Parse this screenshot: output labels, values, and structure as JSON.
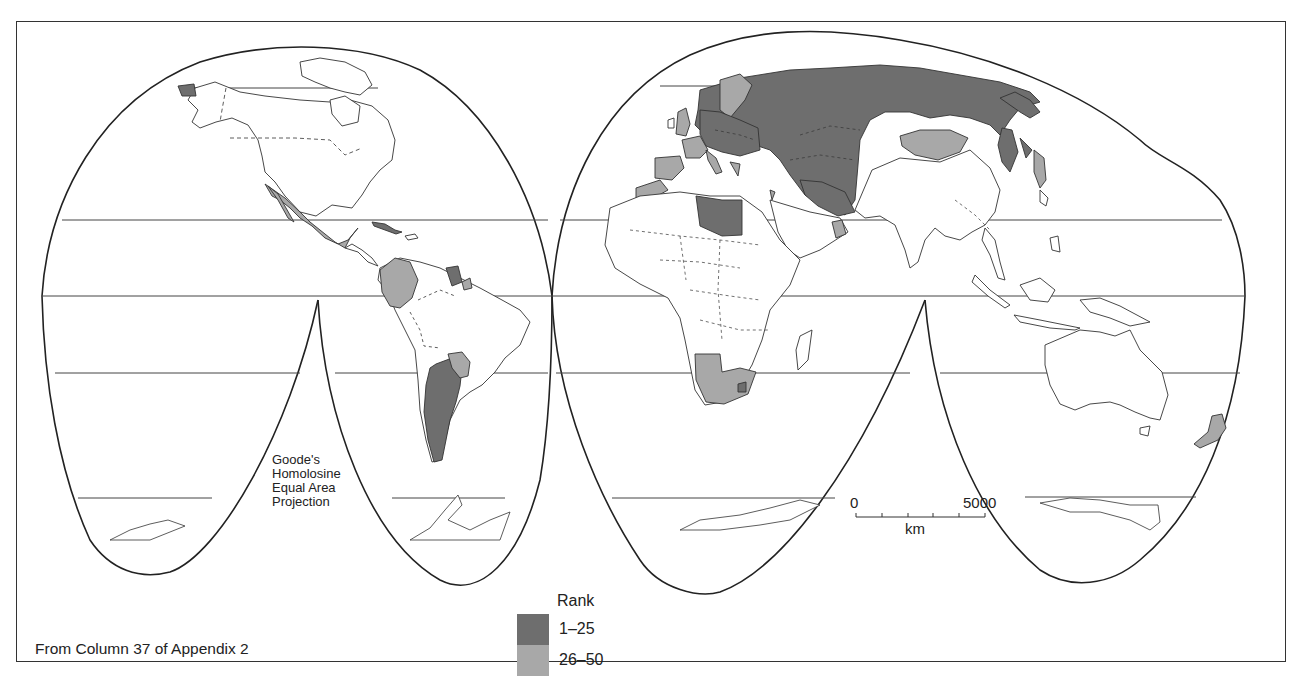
{
  "map": {
    "projection_label": [
      "Goode's",
      "Homolosine",
      "Equal Area",
      "Projection"
    ],
    "source_note": "From Column 37 of Appendix 2",
    "legend": {
      "title": "Rank",
      "items": [
        {
          "label": "1–25",
          "color": "#6e6e6e"
        },
        {
          "label": "26–50",
          "color": "#a8a8a8"
        }
      ]
    },
    "scale_bar": {
      "start_label": "0",
      "end_label": "5000",
      "unit": "km",
      "ticks": 5
    },
    "colors": {
      "rank_1_25": "#6e6e6e",
      "rank_26_50": "#a8a8a8",
      "land_outline": "#333333",
      "background": "#ffffff"
    },
    "shaded_regions": {
      "rank_1_25": [
        "Russia",
        "Ukraine",
        "Belarus",
        "Poland",
        "Germany",
        "Czech Republic",
        "Austria",
        "Hungary",
        "Romania",
        "Baltic States",
        "Kazakhstan",
        "Uzbekistan",
        "Turkmenistan",
        "Iran",
        "Libya",
        "Argentina",
        "Cuba",
        "Guyana",
        "Suriname",
        "Lesotho",
        "Chukotka (Alaska tip)",
        "North Korea"
      ],
      "rank_26_50": [
        "Mexico",
        "Colombia",
        "Ecuador",
        "Venezuela",
        "Paraguay",
        "Uruguay",
        "Norway",
        "Sweden",
        "Finland",
        "United Kingdom",
        "France",
        "Spain",
        "Morocco",
        "Italy",
        "Greece",
        "Oman",
        "Mongolia",
        "South Korea",
        "Namibia",
        "South Africa",
        "New Zealand",
        "Israel"
      ]
    }
  }
}
